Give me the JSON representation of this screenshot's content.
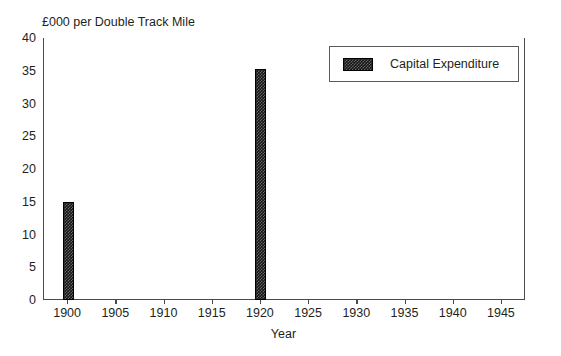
{
  "chart_data": {
    "type": "bar",
    "title": "£000 per Double Track Mile",
    "xlabel": "Year",
    "ylabel": "",
    "categories": [
      1900,
      1920
    ],
    "values": [
      15.0,
      35.2
    ],
    "series": [
      {
        "name": "Capital Expenditure",
        "color": "#151515",
        "values": [
          15.0,
          35.2
        ]
      }
    ],
    "xlim": [
      1897.5,
      1947.5
    ],
    "ylim": [
      0,
      40
    ],
    "xticks": [
      "1900",
      "1905",
      "1910",
      "1915",
      "1920",
      "1925",
      "1930",
      "1935",
      "1940",
      "1945"
    ],
    "xtick_values": [
      1900,
      1905,
      1910,
      1915,
      1920,
      1925,
      1930,
      1935,
      1940,
      1945
    ],
    "yticks": [
      "0",
      "5",
      "10",
      "15",
      "20",
      "25",
      "30",
      "35",
      "40"
    ],
    "ytick_values": [
      0,
      5,
      10,
      15,
      20,
      25,
      30,
      35,
      40
    ],
    "grid": false,
    "legend_position": "upper right"
  },
  "legend": {
    "entries": [
      {
        "label": "Capital Expenditure",
        "swatch_color": "#151515"
      }
    ]
  },
  "colors": {
    "bar_fill": "#151515",
    "axis_line": "#4a4a4a",
    "text": "#231f20",
    "background": "#ffffff"
  }
}
